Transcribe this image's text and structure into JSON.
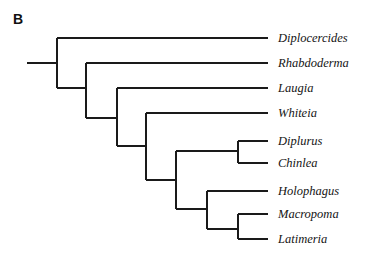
{
  "figure": {
    "panel_label": "B",
    "background_color": "#ffffff",
    "line_color": "#1a1a1a",
    "text_color": "#141414",
    "width": 367,
    "height": 258
  },
  "chart_data": {
    "type": "diagram",
    "subtype": "cladogram",
    "title": "B",
    "orientation": "left-to-right rectangular cladogram",
    "taxa_count": 9,
    "root_stem": {
      "x1": 27,
      "x2": 57,
      "y": 63
    },
    "tips": [
      {
        "name": "Diplocercides",
        "y": 38,
        "branch_x1": 57,
        "branch_x2": 268,
        "label_x": 278
      },
      {
        "name": "Rhabdoderma",
        "y": 63,
        "branch_x1": 86,
        "branch_x2": 268,
        "label_x": 278
      },
      {
        "name": "Laugia",
        "y": 88,
        "branch_x1": 117,
        "branch_x2": 268,
        "label_x": 278
      },
      {
        "name": "Whiteia",
        "y": 113,
        "branch_x1": 146,
        "branch_x2": 268,
        "label_x": 278
      },
      {
        "name": "Diplurus",
        "y": 141,
        "branch_x1": 238,
        "branch_x2": 268,
        "label_x": 278
      },
      {
        "name": "Chinlea",
        "y": 163,
        "branch_x1": 238,
        "branch_x2": 268,
        "label_x": 278
      },
      {
        "name": "Holophagus",
        "y": 191,
        "branch_x1": 207,
        "branch_x2": 268,
        "label_x": 278
      },
      {
        "name": "Macropoma",
        "y": 214,
        "branch_x1": 238,
        "branch_x2": 268,
        "label_x": 278
      },
      {
        "name": "Latimeria",
        "y": 239,
        "branch_x1": 238,
        "branch_x2": 268,
        "label_x": 278
      }
    ],
    "internal_nodes": [
      {
        "id": "N1",
        "x": 57,
        "y_top": 38,
        "y_bottom": 88,
        "children": [
          "Diplocercides",
          "N2"
        ]
      },
      {
        "id": "N2",
        "x": 86,
        "y_top": 63,
        "y_bottom": 118,
        "children": [
          "Rhabdoderma",
          "N3"
        ],
        "parent_y": 88
      },
      {
        "id": "N3",
        "x": 117,
        "y_top": 88,
        "y_bottom": 146,
        "children": [
          "Laugia",
          "N4"
        ],
        "parent_y": 118
      },
      {
        "id": "N4",
        "x": 146,
        "y_top": 113,
        "y_bottom": 180,
        "children": [
          "Whiteia",
          "N5"
        ],
        "parent_y": 146
      },
      {
        "id": "N5",
        "x": 176,
        "y_top": 151,
        "y_bottom": 209,
        "children": [
          "N7",
          "N6"
        ],
        "parent_y": 180
      },
      {
        "id": "N6",
        "x": 207,
        "y_top": 191,
        "y_bottom": 229,
        "children": [
          "Holophagus",
          "N8"
        ],
        "parent_y": 209
      },
      {
        "id": "N7",
        "x": 238,
        "y_top": 141,
        "y_bottom": 163,
        "children": [
          "Diplurus",
          "Chinlea"
        ],
        "parent_y": 151
      },
      {
        "id": "N8",
        "x": 238,
        "y_top": 214,
        "y_bottom": 239,
        "children": [
          "Macropoma",
          "Latimeria"
        ],
        "parent_y": 229
      }
    ],
    "connector_branches": [
      {
        "from": "N1",
        "to": "N2",
        "x1": 57,
        "x2": 86,
        "y": 88
      },
      {
        "from": "N2",
        "to": "N3",
        "x1": 86,
        "x2": 117,
        "y": 118
      },
      {
        "from": "N3",
        "to": "N4",
        "x1": 117,
        "x2": 146,
        "y": 146
      },
      {
        "from": "N4",
        "to": "N5",
        "x1": 146,
        "x2": 176,
        "y": 180
      },
      {
        "from": "N5",
        "to": "N7",
        "x1": 176,
        "x2": 238,
        "y": 151
      },
      {
        "from": "N5",
        "to": "N6",
        "x1": 176,
        "x2": 207,
        "y": 209
      },
      {
        "from": "N6",
        "to": "N8",
        "x1": 207,
        "x2": 238,
        "y": 229
      }
    ],
    "stroke_width": 1.3,
    "grid": false,
    "legend": false
  }
}
